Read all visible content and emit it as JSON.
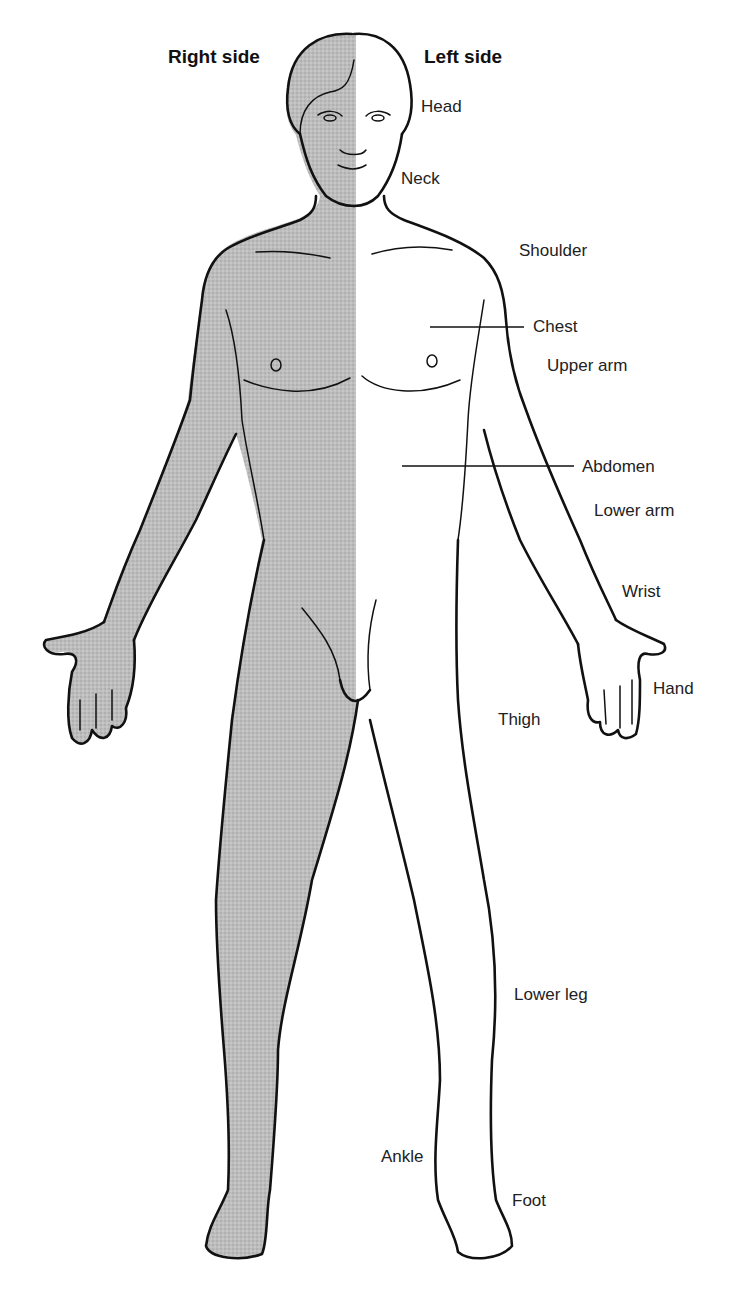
{
  "figure": {
    "type": "anatomical-body-diagram",
    "colors": {
      "shaded_side": "#b9b9b9",
      "unshaded_side": "#ffffff",
      "outline": "#111111",
      "text": "#222222"
    }
  },
  "sides": {
    "right": "Right side",
    "left": "Left side"
  },
  "labels": {
    "head": "Head",
    "neck": "Neck",
    "shoulder": "Shoulder",
    "chest": "Chest",
    "upper_arm": "Upper arm",
    "abdomen": "Abdomen",
    "lower_arm": "Lower arm",
    "wrist": "Wrist",
    "hand": "Hand",
    "thigh": "Thigh",
    "lower_leg": "Lower leg",
    "ankle": "Ankle",
    "foot": "Foot"
  }
}
